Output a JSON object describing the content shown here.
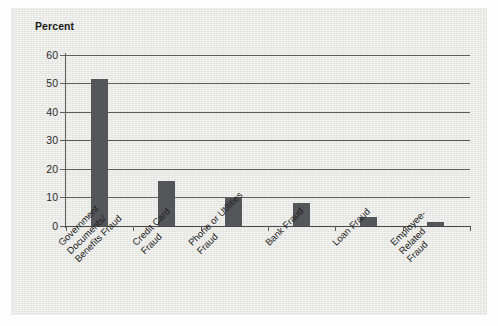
{
  "chart_data": {
    "type": "bar",
    "title": "",
    "subtitle": "",
    "xlabel": "",
    "ylabel": "Percent",
    "ylim": [
      0,
      60
    ],
    "ytick_labels": [
      "60",
      "50",
      "40",
      "30",
      "20",
      "10",
      "0"
    ],
    "ytick_values": [
      60,
      50,
      40,
      30,
      20,
      10,
      0
    ],
    "grid": true,
    "legend": "none",
    "categories": [
      "Government Documents/ Benefits Fraud",
      "Credit Card Fraud",
      "Phone or Utilities Fraud",
      "Bank Fraud",
      "Loan Fraud",
      "Employee-Related Fraud"
    ],
    "category_lines": [
      [
        "Government",
        "Documents/",
        "Benefits Fraud"
      ],
      [
        "Credit Card",
        "Fraud"
      ],
      [
        "Phone or Utilities",
        "Fraud"
      ],
      [
        "Bank Fraud"
      ],
      [
        "Loan Fraud"
      ],
      [
        "Employee-",
        "Related",
        "Fraud"
      ]
    ],
    "values": [
      51.5,
      15.8,
      9.7,
      8.0,
      3.0,
      1.5
    ],
    "bar_color": "#55565a",
    "axis_color": "#5d5d5d",
    "panel_color": "#e9e9e6"
  }
}
